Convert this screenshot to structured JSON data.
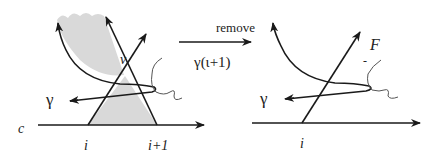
{
  "left_panel": {
    "labels": {
      "gamma": "γ",
      "v": "v",
      "c": "c",
      "i": "i",
      "i_plus_1": "i+1"
    }
  },
  "transition": {
    "label_top": "remove",
    "label_bottom": "γ(ι+1)"
  },
  "right_panel": {
    "labels": {
      "gamma": "γ",
      "F": "F",
      "minus": "-",
      "i": "i"
    }
  },
  "colors": {
    "stroke": "#1a1a1a",
    "shade": "#d9d9d9"
  }
}
